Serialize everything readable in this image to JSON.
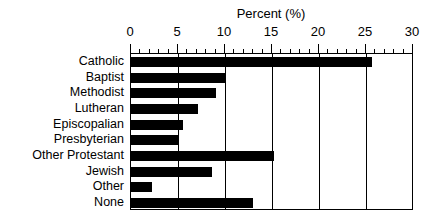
{
  "chart_data": {
    "type": "bar",
    "orientation": "horizontal",
    "title": "Percent (%)",
    "xlabel": "Percent (%)",
    "ylabel": "",
    "xlim": [
      0,
      30
    ],
    "xticks": [
      0,
      5,
      10,
      15,
      20,
      25,
      30
    ],
    "xtick_labels": [
      "0",
      "5",
      "10",
      "15",
      "20",
      "25",
      "30"
    ],
    "minor_tick_step": 1,
    "grid": true,
    "grid_axis": "x",
    "legend": false,
    "bar_color": "#000000",
    "categories": [
      "Catholic",
      "Baptist",
      "Methodist",
      "Lutheran",
      "Episcopalian",
      "Presbyterian",
      "Other Protestant",
      "Jewish",
      "Other",
      "None"
    ],
    "values": [
      25.6,
      10.0,
      9.0,
      7.1,
      5.5,
      5.0,
      15.2,
      8.6,
      2.2,
      13.0
    ]
  }
}
